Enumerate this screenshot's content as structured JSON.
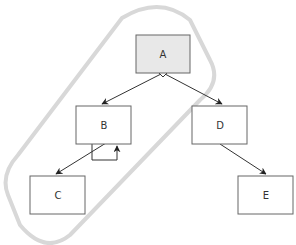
{
  "diagram": {
    "nodes": {
      "A": {
        "label": "A",
        "fill": "#e8e8e8"
      },
      "B": {
        "label": "B",
        "fill": "#ffffff"
      },
      "C": {
        "label": "C",
        "fill": "#ffffff"
      },
      "D": {
        "label": "D",
        "fill": "#ffffff"
      },
      "E": {
        "label": "E",
        "fill": "#ffffff"
      }
    },
    "edges": [
      {
        "from": "A",
        "to": "B",
        "start": "diamond"
      },
      {
        "from": "A",
        "to": "D",
        "start": "diamond"
      },
      {
        "from": "B",
        "to": "C"
      },
      {
        "from": "B",
        "to": "B",
        "type": "self-loop"
      },
      {
        "from": "D",
        "to": "E"
      }
    ],
    "group_outline_color": "#d8d8d8"
  }
}
